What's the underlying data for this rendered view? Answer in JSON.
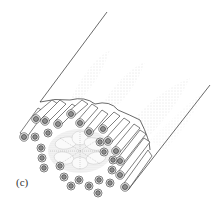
{
  "figure": {
    "panel_label": "(c)",
    "colors": {
      "line": "#2a2a2a",
      "tube_fill": "#ffffff",
      "stipple": "#9a9a9a",
      "hub_fill": "#f2f2f2",
      "ring_fill": "#8c8c8c"
    }
  }
}
